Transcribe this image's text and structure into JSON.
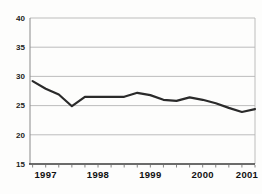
{
  "chart_data": {
    "type": "line",
    "x_unit": "year, quarterly points",
    "x": [
      1996.75,
      1997.0,
      1997.25,
      1997.5,
      1997.75,
      1998.0,
      1998.25,
      1998.5,
      1998.75,
      1999.0,
      1999.25,
      1999.5,
      1999.75,
      2000.0,
      2000.25,
      2000.5,
      2000.75,
      2001.0
    ],
    "values": [
      29.2,
      27.9,
      26.9,
      24.9,
      26.5,
      26.5,
      26.5,
      26.5,
      27.2,
      26.8,
      26.0,
      25.8,
      26.4,
      26.0,
      25.4,
      24.6,
      23.9,
      24.4
    ],
    "x_ticks": [
      1997,
      1998,
      1999,
      2000,
      2001
    ],
    "y_ticks": [
      15,
      20,
      25,
      30,
      35,
      40
    ],
    "xlim": [
      1996.7,
      2001.0
    ],
    "ylim": [
      15,
      40
    ],
    "x_minor_start": 1996.75,
    "x_minor_tick_interval": 0.25,
    "grid": "horizontal",
    "legend": "none",
    "title": "",
    "xlabel": "",
    "ylabel": "",
    "colors": {
      "line": "#2a2a2a",
      "grid": "#b5b5b5",
      "axis_bottom": "#3a3a3a",
      "axis_left": "#8a8a8a",
      "minor_tick": "#666666",
      "x_label": "#111111",
      "y_label": "#222222",
      "background": "#fdfdfc"
    }
  }
}
